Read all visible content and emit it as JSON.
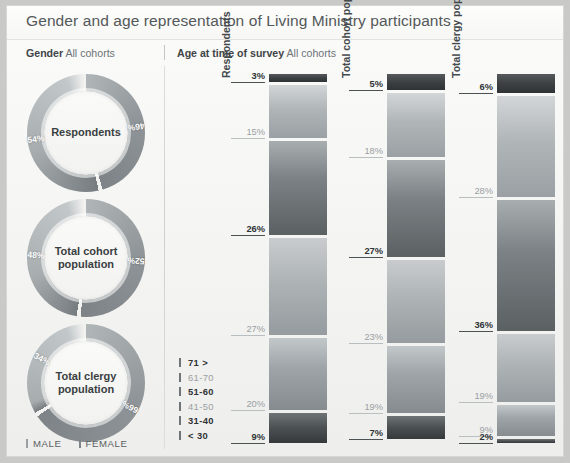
{
  "title": "Gender and age representation of Living Ministry participants",
  "gender_panel": {
    "heading_bold": "Gender",
    "heading_rest": "All cohorts",
    "donuts": [
      {
        "label": "Respondents",
        "male_pct": "54%",
        "female_pct": "46%",
        "male": 54,
        "female": 46
      },
      {
        "label": "Total cohort\npopulation",
        "male_pct": "48%",
        "female_pct": "52%",
        "male": 48,
        "female": 52
      },
      {
        "label": "Total clergy\npopulation",
        "male_pct": "34%",
        "female_pct": "66%",
        "male": 34,
        "female": 66
      }
    ],
    "legend": [
      {
        "key": "male-swatch",
        "label": "MALE",
        "color": "#9aa0a2"
      },
      {
        "key": "female-swatch",
        "label": "FEMALE",
        "color": "#7e8487"
      }
    ]
  },
  "age_panel": {
    "heading_bold": "Age at time of survey",
    "heading_rest": "All cohorts",
    "legend": [
      {
        "label": "71 >",
        "style": "dark"
      },
      {
        "label": "61-70",
        "style": "light"
      },
      {
        "label": "51-60",
        "style": "dark"
      },
      {
        "label": "41-50",
        "style": "light"
      },
      {
        "label": "31-40",
        "style": "dark"
      },
      {
        "label": "< 30",
        "style": "dark"
      }
    ]
  },
  "chart_data": {
    "type": "bar",
    "title": "Gender and age representation of Living Ministry participants",
    "subtitle": "Age at time of survey — All cohorts",
    "xlabel": "",
    "ylabel": "Share of group (%)",
    "ylim": [
      0,
      100
    ],
    "grid": false,
    "legend_position": "left-bottom",
    "orientation": "vertical-stacked-100",
    "categories": [
      "Respondents",
      "Total cohort population",
      "Total clergy population"
    ],
    "stack_order_top_to_bottom": [
      "71 >",
      "61-70",
      "51-60",
      "41-50",
      "31-40",
      "< 30"
    ],
    "series": [
      {
        "name": "71 >",
        "values": [
          3,
          5,
          6
        ],
        "labels": [
          "3%",
          "5%",
          "6%"
        ],
        "style": "dark"
      },
      {
        "name": "61-70",
        "values": [
          15,
          18,
          28
        ],
        "labels": [
          "15%",
          "18%",
          "28%"
        ],
        "style": "light"
      },
      {
        "name": "51-60",
        "values": [
          26,
          27,
          36
        ],
        "labels": [
          "26%",
          "27%",
          "36%"
        ],
        "style": "dark"
      },
      {
        "name": "41-50",
        "values": [
          27,
          23,
          19
        ],
        "labels": [
          "27%",
          "23%",
          "19%"
        ],
        "style": "light"
      },
      {
        "name": "31-40",
        "values": [
          20,
          19,
          9
        ],
        "labels": [
          "20%",
          "19%",
          "9%"
        ],
        "style": "light"
      },
      {
        "name": "< 30",
        "values": [
          9,
          7,
          2
        ],
        "labels": [
          "9%",
          "7%",
          "2%"
        ],
        "style": "dark"
      }
    ],
    "donut_series": {
      "type": "pie",
      "categories": [
        "Respondents",
        "Total cohort population",
        "Total clergy population"
      ],
      "slices": [
        {
          "name": "MALE",
          "values": [
            54,
            48,
            34
          ],
          "labels": [
            "54%",
            "48%",
            "34%"
          ]
        },
        {
          "name": "FEMALE",
          "values": [
            46,
            52,
            66
          ],
          "labels": [
            "46%",
            "52%",
            "66%"
          ]
        }
      ]
    }
  },
  "colors": {
    "page_background": "#c9c9c7",
    "poster_background": "#f7f7f5",
    "title_text": "#54585a",
    "bar_dark": "#4a4f52",
    "bar_light": "#9ba1a4",
    "label_dark": "#2f3437",
    "label_light": "#9aa0a3"
  }
}
